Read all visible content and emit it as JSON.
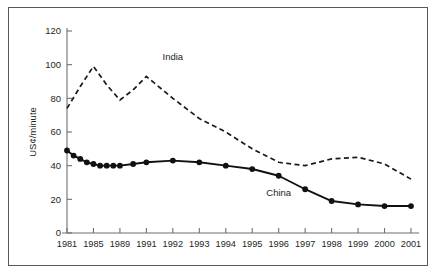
{
  "figure": {
    "background_color": "#ffffff",
    "border_color": "#58595b",
    "axis_color": "#6d6e71",
    "text_color": "#231f20"
  },
  "chart_data": {
    "type": "line",
    "title": "",
    "subtitle": "",
    "xlabel": "",
    "ylabel": "US¢/minute",
    "x": [
      "1981",
      "1985",
      "1989",
      "1991",
      "1992",
      "1993",
      "1994",
      "1995",
      "1996",
      "1997",
      "1998",
      "1999",
      "2000",
      "2001"
    ],
    "categories": [
      "1981",
      "1985",
      "1989",
      "1991",
      "1992",
      "1993",
      "1994",
      "1995",
      "1996",
      "1997",
      "1998",
      "1999",
      "2000",
      "2001"
    ],
    "xtick_labels": [
      "1981",
      "1985",
      "1989",
      "1991",
      "1992",
      "1993",
      "1994",
      "1995",
      "1996",
      "1997",
      "1998",
      "1999",
      "2000",
      "2001"
    ],
    "ytick_labels": [
      "0",
      "20",
      "40",
      "60",
      "80",
      "100",
      "120"
    ],
    "ytick_values": [
      0,
      20,
      40,
      60,
      80,
      100,
      120
    ],
    "ylim": [
      0,
      120
    ],
    "grid": false,
    "legend_position": "inline-annotations",
    "series": [
      {
        "name": "India",
        "style": "dashed",
        "marker": "none",
        "color": "#1a1a1a",
        "label_annotation": "India",
        "x": [
          "1981",
          "1983",
          "1985",
          "1987",
          "1989",
          "1990",
          "1991",
          "1992",
          "1993",
          "1994",
          "1995",
          "1996",
          "1997",
          "1998",
          "1999",
          "2000",
          "2001"
        ],
        "values": [
          74,
          87,
          99,
          88,
          79,
          85,
          93,
          80,
          68,
          60,
          50,
          42,
          40,
          44,
          45,
          41,
          32
        ]
      },
      {
        "name": "China",
        "style": "solid",
        "marker": "filled-circle",
        "color": "#111111",
        "label_annotation": "China",
        "x": [
          "1981",
          "1982",
          "1983",
          "1984",
          "1985",
          "1986",
          "1987",
          "1988",
          "1989",
          "1990",
          "1991",
          "1992",
          "1993",
          "1994",
          "1995",
          "1996",
          "1997",
          "1998",
          "1999",
          "2000",
          "2001"
        ],
        "values": [
          49,
          46,
          44,
          42,
          41,
          40,
          40,
          40,
          40,
          41,
          42,
          43,
          42,
          40,
          38,
          34,
          26,
          19,
          17,
          16,
          16
        ]
      }
    ],
    "annotations": [
      {
        "text": "India",
        "series": "India",
        "at_x": "1992",
        "at_y": 103
      },
      {
        "text": "China",
        "series": "China",
        "at_x": "1996",
        "at_y": 22
      }
    ]
  }
}
